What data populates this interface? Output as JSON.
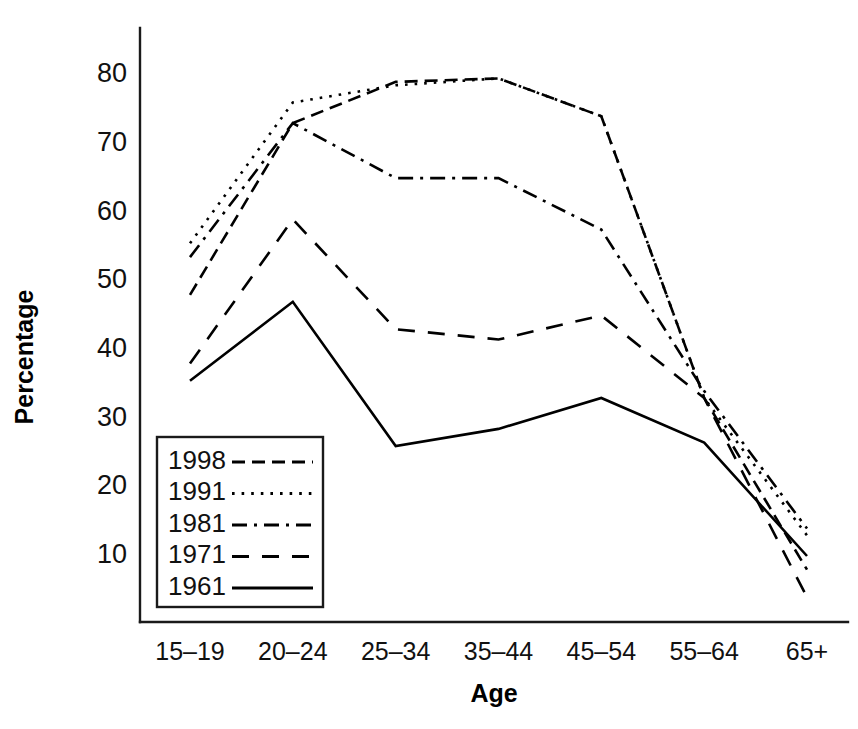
{
  "chart_data": {
    "type": "line",
    "title": "",
    "xlabel": "Age",
    "ylabel": "Percentage",
    "categories": [
      "15–19",
      "20–24",
      "25–34",
      "35–44",
      "45–54",
      "55–64",
      "65+"
    ],
    "xtick_labels": [
      "15–19",
      "20–24",
      "25–34",
      "35–44",
      "45–54",
      "55–64",
      "65+"
    ],
    "ytick_labels": [
      "10",
      "20",
      "30",
      "40",
      "50",
      "60",
      "70",
      "80"
    ],
    "ytick_values": [
      10,
      20,
      30,
      40,
      50,
      60,
      70,
      80
    ],
    "ylim": [
      3,
      84
    ],
    "xlim": [
      0,
      6
    ],
    "grid": false,
    "legend_position": "inner-lower-left",
    "series": [
      {
        "name": "1998",
        "label": "1998",
        "dash": "medium-dash",
        "values": [
          48,
          73,
          79,
          79.5,
          74,
          33,
          8
        ]
      },
      {
        "name": "1991",
        "label": "1991",
        "dash": "dotted",
        "values": [
          55.5,
          76,
          78.5,
          79.5,
          74,
          33,
          13
        ]
      },
      {
        "name": "1981",
        "label": "1981",
        "dash": "dash-dot",
        "values": [
          53.5,
          73,
          65,
          65,
          57.5,
          34,
          14
        ]
      },
      {
        "name": "1971",
        "label": "1971",
        "dash": "long-dash",
        "values": [
          38,
          59,
          43,
          41.5,
          45,
          33,
          4
        ]
      },
      {
        "name": "1961",
        "label": "1961",
        "dash": "solid",
        "values": [
          35.5,
          47,
          26,
          28.5,
          33,
          26.5,
          10
        ]
      }
    ]
  },
  "legend": {
    "entries": [
      {
        "label": "1998"
      },
      {
        "label": "1991"
      },
      {
        "label": "1981"
      },
      {
        "label": "1971"
      },
      {
        "label": "1961"
      }
    ]
  },
  "colors": {
    "ink": "#000000",
    "axis": "#1a1a1a",
    "background": "#ffffff"
  }
}
